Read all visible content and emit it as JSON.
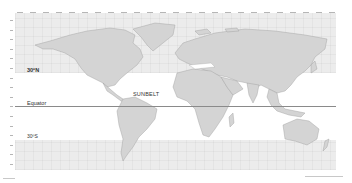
{
  "map": {
    "title": "World map showing the Sunbelt between 30°N and 30°S",
    "labels": {
      "north": "30ºN",
      "equator": "Equator",
      "sunbelt": "SUNBELT",
      "south": "30ºS"
    },
    "colors": {
      "land": "#d4d4d4",
      "land_border": "#9a9a9a",
      "outside_band": "#ececec",
      "sunbelt": "#ffffff",
      "equator_line": "#8a8a8a"
    },
    "regions": {
      "sunbelt_range": [
        "30ºN",
        "30ºS"
      ]
    }
  }
}
